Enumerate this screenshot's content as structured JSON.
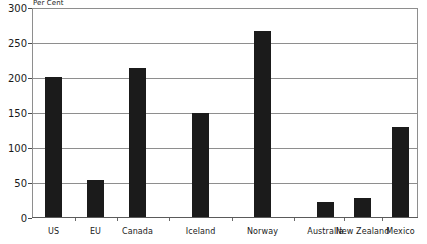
{
  "chart_data": {
    "type": "bar",
    "title": "",
    "subtitle": "",
    "unit_caption": "Per Cent",
    "xlabel": "",
    "ylabel": "Per Cent",
    "categories": [
      "US",
      "EU",
      "Canada",
      "Iceland",
      "Norway",
      "Australia",
      "New Zealand",
      "Mexico"
    ],
    "values": [
      200,
      53,
      213,
      148,
      265,
      22,
      27,
      128
    ],
    "ylim": [
      0,
      300
    ],
    "ytick_labels": [
      "0",
      "50",
      "100",
      "150",
      "200",
      "250",
      "300"
    ],
    "ytick_values": [
      0,
      50,
      100,
      150,
      200,
      250,
      300
    ],
    "grid": true,
    "legend": false,
    "legend_position": "none",
    "bar_color": "#1b1b1b",
    "grid_color": "#8e8e8e",
    "axis_color": "#5a5a5a",
    "background": "#ffffff"
  }
}
